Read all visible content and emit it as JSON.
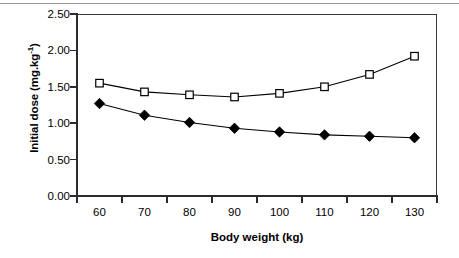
{
  "chart_data": {
    "type": "line",
    "title": "",
    "xlabel": "Body weight (kg)",
    "ylabel": "Initial dose (mg.kg-1)",
    "ylabel_base": "Initial dose (mg.kg",
    "ylabel_sup": "-1",
    "ylabel_tail": ")",
    "x": [
      60,
      70,
      80,
      90,
      100,
      110,
      120,
      130
    ],
    "xticklabels": [
      "60",
      "70",
      "80",
      "90",
      "100",
      "110",
      "120",
      "130"
    ],
    "yticklabels": [
      "0.00",
      "0.50",
      "1.00",
      "1.50",
      "2.00",
      "2.50"
    ],
    "ytickvalues": [
      0.0,
      0.5,
      1.0,
      1.5,
      2.0,
      2.5
    ],
    "xlim": [
      55,
      135
    ],
    "ylim": [
      0.0,
      2.5
    ],
    "grid": false,
    "legend": "none",
    "series": [
      {
        "name": "open-square-series",
        "marker": "open-square",
        "color": "#000000",
        "values": [
          1.55,
          1.43,
          1.39,
          1.36,
          1.41,
          1.5,
          1.67,
          1.92
        ]
      },
      {
        "name": "filled-diamond-series",
        "marker": "filled-diamond",
        "color": "#000000",
        "values": [
          1.27,
          1.11,
          1.01,
          0.93,
          0.88,
          0.84,
          0.82,
          0.8
        ]
      }
    ]
  },
  "axes": {
    "y_title": "Initial dose (mg.kg",
    "y_title_sup": "-1",
    "y_title_end": ")",
    "x_title": "Body weight (kg)"
  }
}
